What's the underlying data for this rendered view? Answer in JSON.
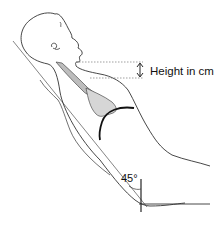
{
  "diagram": {
    "labels": {
      "height": "Height in cm",
      "angle": "45°"
    },
    "colors": {
      "outline": "#333333",
      "incline_line": "#666666",
      "vein_fill": "#bdbdbd",
      "heart_fill": "#d6d6d6",
      "heart_border": "#111111",
      "guide_dotted": "#777777"
    },
    "elements": [
      "head-profile",
      "ear",
      "incline-line",
      "jugular-vein",
      "right-atrium-shading",
      "heart-border-arc",
      "measurement-arrow",
      "dotted-reference-lines",
      "angle-marker",
      "bed-baseline"
    ]
  }
}
